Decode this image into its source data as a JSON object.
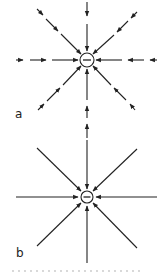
{
  "figure": {
    "panels": [
      {
        "id": "a",
        "label": "a",
        "charge": {
          "sign": "−",
          "symbol": "minus-sign",
          "cx": 87,
          "cy": 60,
          "r": 7
        },
        "line_style": "dashed-arrows",
        "description": "Field of a negative charge shown with segmented arrows pointing inward"
      },
      {
        "id": "b",
        "label": "b",
        "charge": {
          "sign": "−",
          "symbol": "minus-sign",
          "cx": 87,
          "cy": 197,
          "r": 6
        },
        "line_style": "continuous-lines",
        "description": "Field lines of a negative charge converging radially inward"
      }
    ],
    "colors": {
      "ink": "#222222",
      "background": "#ffffff"
    }
  }
}
